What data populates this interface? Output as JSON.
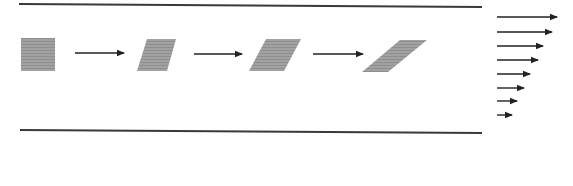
{
  "diagram": {
    "title": "Simple shear flow between parallel plates",
    "colors": {
      "plate": "#3a3a3a",
      "element": "#9a9a9a",
      "arrow": "#222222",
      "background": "#ffffff"
    },
    "plates": [
      {
        "name": "top-plate",
        "x1": 19,
        "y1": 4,
        "x2": 482,
        "y2": 7
      },
      {
        "name": "bottom-plate",
        "x1": 20,
        "y1": 130,
        "x2": 482,
        "y2": 133
      }
    ],
    "elements": [
      {
        "name": "fluid-element-stage-1",
        "points": "21,38 55,38 55,71 21,71"
      },
      {
        "name": "fluid-element-stage-2",
        "points": "147,39 176,39 167,71 137,71"
      },
      {
        "name": "fluid-element-stage-3",
        "points": "266,39 301,39 284,71 249,71"
      },
      {
        "name": "fluid-element-stage-4",
        "points": "400,40 427,40 388,72 362,72"
      }
    ],
    "transition_arrows": [
      {
        "name": "transition-arrow-1",
        "x1": 75,
        "x2": 124,
        "y": 53
      },
      {
        "name": "transition-arrow-2",
        "x1": 194,
        "x2": 242,
        "y": 54
      },
      {
        "name": "transition-arrow-3",
        "x1": 313,
        "x2": 363,
        "y": 54
      }
    ],
    "velocity_profile": {
      "label": "velocity profile",
      "x_start": 497,
      "arrows": [
        {
          "y": 17,
          "length": 60
        },
        {
          "y": 32,
          "length": 55
        },
        {
          "y": 46,
          "length": 46
        },
        {
          "y": 60,
          "length": 41
        },
        {
          "y": 74,
          "length": 33
        },
        {
          "y": 88,
          "length": 27
        },
        {
          "y": 101,
          "length": 20
        },
        {
          "y": 115,
          "length": 15
        }
      ]
    }
  }
}
